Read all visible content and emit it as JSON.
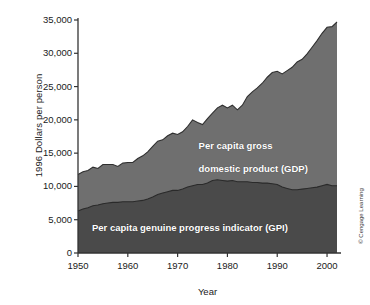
{
  "chart_data": {
    "type": "area",
    "title": "",
    "xlabel": "Year",
    "ylabel": "1996 Dollars per person",
    "xlim": [
      1950,
      2002
    ],
    "ylim": [
      0,
      35000
    ],
    "grid": false,
    "legend_position": "in-plot annotations",
    "stacked_bands": true,
    "x_ticks": [
      "1950",
      "1960",
      "1970",
      "1980",
      "1990",
      "2000"
    ],
    "y_ticks": [
      "0",
      "5,000",
      "10,000",
      "15,000",
      "20,000",
      "25,000",
      "30,000",
      "35,000"
    ],
    "annotations": [
      "Per capita gross\ndomestic product (GDP)",
      "Per capita genuine progress indicator (GPI)"
    ],
    "credit": "© Cengage Learning",
    "x": [
      1950,
      1951,
      1952,
      1953,
      1954,
      1955,
      1956,
      1957,
      1958,
      1959,
      1960,
      1961,
      1962,
      1963,
      1964,
      1965,
      1966,
      1967,
      1968,
      1969,
      1970,
      1971,
      1972,
      1973,
      1974,
      1975,
      1976,
      1977,
      1978,
      1979,
      1980,
      1981,
      1982,
      1983,
      1984,
      1985,
      1986,
      1987,
      1988,
      1989,
      1990,
      1991,
      1992,
      1993,
      1994,
      1995,
      1996,
      1997,
      1998,
      1999,
      2000,
      2001,
      2002
    ],
    "series": [
      {
        "name": "Per capita gross domestic product (GDP)",
        "color": "#6f6f6f",
        "values": [
          11800,
          12200,
          12400,
          12900,
          12700,
          13300,
          13300,
          13300,
          13000,
          13500,
          13600,
          13600,
          14200,
          14600,
          15200,
          16000,
          16800,
          17000,
          17600,
          18000,
          17800,
          18200,
          19000,
          20000,
          19600,
          19300,
          20200,
          21000,
          21800,
          22200,
          21800,
          22200,
          21500,
          22200,
          23500,
          24200,
          24800,
          25500,
          26400,
          27100,
          27300,
          26900,
          27400,
          27900,
          28700,
          29100,
          29900,
          30900,
          31900,
          33000,
          33900,
          34000,
          34700
        ]
      },
      {
        "name": "Per capita genuine progress indicator (GPI)",
        "color": "#4a4a4a",
        "values": [
          6300,
          6600,
          6800,
          7100,
          7200,
          7400,
          7500,
          7600,
          7600,
          7700,
          7700,
          7700,
          7800,
          7900,
          8100,
          8400,
          8800,
          9000,
          9200,
          9400,
          9400,
          9600,
          9900,
          10100,
          10300,
          10300,
          10500,
          10900,
          11000,
          10900,
          10800,
          10900,
          10700,
          10700,
          10700,
          10600,
          10600,
          10500,
          10500,
          10400,
          10300,
          9900,
          9700,
          9500,
          9500,
          9600,
          9700,
          9800,
          9900,
          10100,
          10300,
          10100,
          10100
        ]
      }
    ]
  },
  "axis": {
    "y_title": "1996 Dollars per person",
    "x_title": "Year"
  },
  "labels": {
    "gdp_line1": "Per capita gross",
    "gdp_line2": "domestic product (GDP)",
    "gpi": "Per capita genuine progress indicator (GPI)"
  },
  "credit": {
    "text": "© Cengage Learning"
  },
  "colors": {
    "gdp_band": "#6f6f6f",
    "gpi_band": "#4a4a4a",
    "axis": "#333333",
    "background": "#ffffff",
    "label_text": "#ffffff"
  }
}
